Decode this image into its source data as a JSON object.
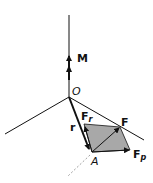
{
  "diagram": {
    "labels": {
      "M": "M",
      "O": "O",
      "r": "r",
      "F": "F",
      "Fr_main": "F",
      "Fr_sub": "r",
      "Fp_main": "F",
      "Fp_sub": "p",
      "A": "A"
    },
    "colors": {
      "line": "#111111",
      "parallelogram": "#a8a8a8",
      "dashed": "#888888"
    }
  }
}
